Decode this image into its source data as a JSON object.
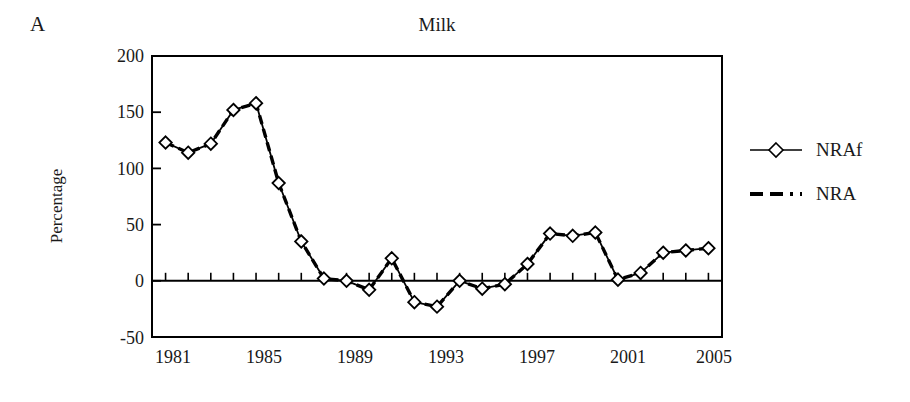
{
  "panel": {
    "label": "A"
  },
  "chart_data": {
    "type": "line",
    "title": "Milk",
    "xlabel": "",
    "ylabel": "Percentage",
    "xlim": [
      1980.4,
      2005.6
    ],
    "ylim": [
      -50,
      200
    ],
    "ytick_values": [
      200,
      150,
      100,
      50,
      0,
      -50
    ],
    "ytick_labels": [
      "200",
      "150",
      "100",
      "50",
      "0",
      "-50"
    ],
    "xtick_values": [
      1981,
      1985,
      1989,
      1993,
      1997,
      2001,
      2005
    ],
    "xtick_labels": [
      "1981",
      "1985",
      "1989",
      "1993",
      "1997",
      "2001",
      "2005"
    ],
    "x": [
      1981,
      1982,
      1983,
      1984,
      1985,
      1986,
      1987,
      1988,
      1989,
      1990,
      1991,
      1992,
      1993,
      1994,
      1995,
      1996,
      1997,
      1998,
      1999,
      2000,
      2001,
      2002,
      2003,
      2004,
      2005
    ],
    "grid": false,
    "legend_position": "right",
    "series": [
      {
        "name": "NRAf",
        "style": "solid-with-diamond-markers",
        "color": "#000000",
        "values": [
          123,
          114,
          122,
          152,
          158,
          87,
          35,
          2,
          0,
          -8,
          20,
          -19,
          -23,
          0,
          -7,
          -3,
          15,
          42,
          40,
          43,
          1,
          7,
          25,
          27,
          29
        ]
      },
      {
        "name": "NRA",
        "style": "dashed",
        "color": "#000000",
        "values": [
          123,
          114,
          122,
          152,
          158,
          87,
          35,
          2,
          0,
          -8,
          20,
          -19,
          -23,
          0,
          -7,
          -3,
          15,
          42,
          40,
          43,
          1,
          7,
          25,
          27,
          29
        ]
      }
    ]
  },
  "legend": {
    "items": [
      {
        "label": "NRAf",
        "marker": "diamond-marker-icon"
      },
      {
        "label": "NRA",
        "marker": "dashed-line-icon"
      }
    ]
  }
}
